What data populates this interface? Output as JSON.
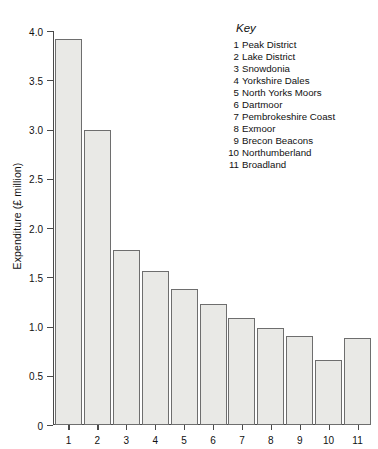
{
  "chart_data": {
    "type": "bar",
    "title": "",
    "xlabel": "",
    "ylabel": "Expenditure (£ million)",
    "categories": [
      "1",
      "2",
      "3",
      "4",
      "5",
      "6",
      "7",
      "8",
      "9",
      "10",
      "11"
    ],
    "values": [
      3.92,
      3.0,
      1.78,
      1.56,
      1.38,
      1.23,
      1.09,
      0.98,
      0.9,
      0.66,
      0.88
    ],
    "series": [
      {
        "name": "Expenditure",
        "values": [
          3.92,
          3.0,
          1.78,
          1.56,
          1.38,
          1.23,
          1.09,
          0.98,
          0.9,
          0.66,
          0.88
        ]
      }
    ],
    "ylim": [
      0,
      4.0
    ],
    "ytick_labels": [
      "0",
      "0.5",
      "1.0",
      "1.5",
      "2.0",
      "2.5",
      "3.0",
      "3.5",
      "4.0"
    ],
    "ytick_values": [
      0,
      0.5,
      1.0,
      1.5,
      2.0,
      2.5,
      3.0,
      3.5,
      4.0
    ],
    "grid": false,
    "legend_position": "top-right",
    "bar_fill_color": "#e9e9e6",
    "bar_border_color": "#6e6e6e",
    "axis_color": "#4a4a4a"
  },
  "key": {
    "title": "Key",
    "items": [
      {
        "number": "1",
        "label": "Peak District"
      },
      {
        "number": "2",
        "label": "Lake District"
      },
      {
        "number": "3",
        "label": "Snowdonia"
      },
      {
        "number": "4",
        "label": "Yorkshire Dales"
      },
      {
        "number": "5",
        "label": "North Yorks Moors"
      },
      {
        "number": "6",
        "label": "Dartmoor"
      },
      {
        "number": "7",
        "label": "Pembrokeshire Coast"
      },
      {
        "number": "8",
        "label": "Exmoor"
      },
      {
        "number": "9",
        "label": "Brecon Beacons"
      },
      {
        "number": "10",
        "label": "Northumberland"
      },
      {
        "number": "11",
        "label": "Broadland"
      }
    ]
  }
}
